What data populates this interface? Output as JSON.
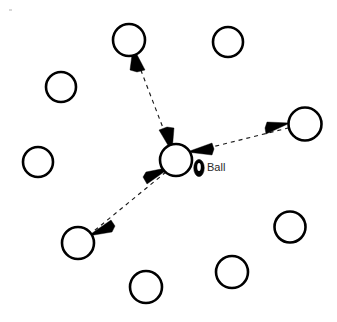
{
  "diagram": {
    "background_color": "#ffffff",
    "stroke_color": "#000000",
    "dash_color": "#1a1a1a",
    "label_color": "#2a2a2a",
    "labels": [
      {
        "id": "ball-label",
        "text": "Ball",
        "x": 207,
        "y": 168
      }
    ],
    "ball": {
      "name": "ball",
      "cx": 199,
      "cy": 168,
      "rx": 5.2,
      "ry": 8.6,
      "fill": "#000000",
      "highlight": {
        "cx": 199,
        "cy": 167,
        "rx": 1.8,
        "ry": 4.0,
        "fill": "#ffffff"
      }
    },
    "players": [
      {
        "id": "player-center",
        "label": "center player",
        "cx": 176,
        "cy": 160,
        "r": 16.0,
        "active": true
      },
      {
        "id": "player-top",
        "label": "top player",
        "cx": 129,
        "cy": 40,
        "r": 16.0,
        "active": false
      },
      {
        "id": "player-top-right",
        "label": "top right player",
        "cx": 228,
        "cy": 42,
        "r": 15.0,
        "active": false
      },
      {
        "id": "player-upper-left",
        "label": "upper left player",
        "cx": 61,
        "cy": 87,
        "r": 15.0,
        "active": false
      },
      {
        "id": "player-left",
        "label": "left player",
        "cx": 38,
        "cy": 162,
        "r": 15.0,
        "active": false
      },
      {
        "id": "player-right",
        "label": "right player",
        "cx": 305,
        "cy": 124,
        "r": 16.5,
        "active": false
      },
      {
        "id": "player-lower-left",
        "label": "lower left player",
        "cx": 78,
        "cy": 243,
        "r": 16.0,
        "active": false
      },
      {
        "id": "player-bottom-right",
        "label": "bottom right player",
        "cx": 290,
        "cy": 227,
        "r": 15.5,
        "active": false
      },
      {
        "id": "player-bottom",
        "label": "bottom player",
        "cx": 232,
        "cy": 272,
        "r": 16.0,
        "active": false
      },
      {
        "id": "player-bottom-mid",
        "label": "bottom mid player",
        "cx": 146,
        "cy": 287,
        "r": 16.0,
        "active": false
      }
    ],
    "pass_links": [
      {
        "id": "pass-center-to-top",
        "label": "pass to top player",
        "from": "player-center",
        "to": "player-top",
        "x1": 169,
        "y1": 143,
        "x2": 136,
        "y2": 58,
        "double_headed": true
      },
      {
        "id": "pass-center-to-right",
        "label": "pass to right player",
        "from": "player-center",
        "to": "player-right",
        "x1": 191,
        "y1": 152,
        "x2": 289,
        "y2": 127,
        "double_headed": true
      },
      {
        "id": "pass-center-to-lower-left",
        "label": "pass to lower left player",
        "from": "player-center",
        "to": "player-lower-left",
        "x1": 164,
        "y1": 172,
        "x2": 92,
        "y2": 232,
        "double_headed": true
      }
    ],
    "specks": [
      {
        "id": "speck-top-left",
        "x": 9,
        "y": 9,
        "w": 3,
        "h": 2
      }
    ]
  }
}
